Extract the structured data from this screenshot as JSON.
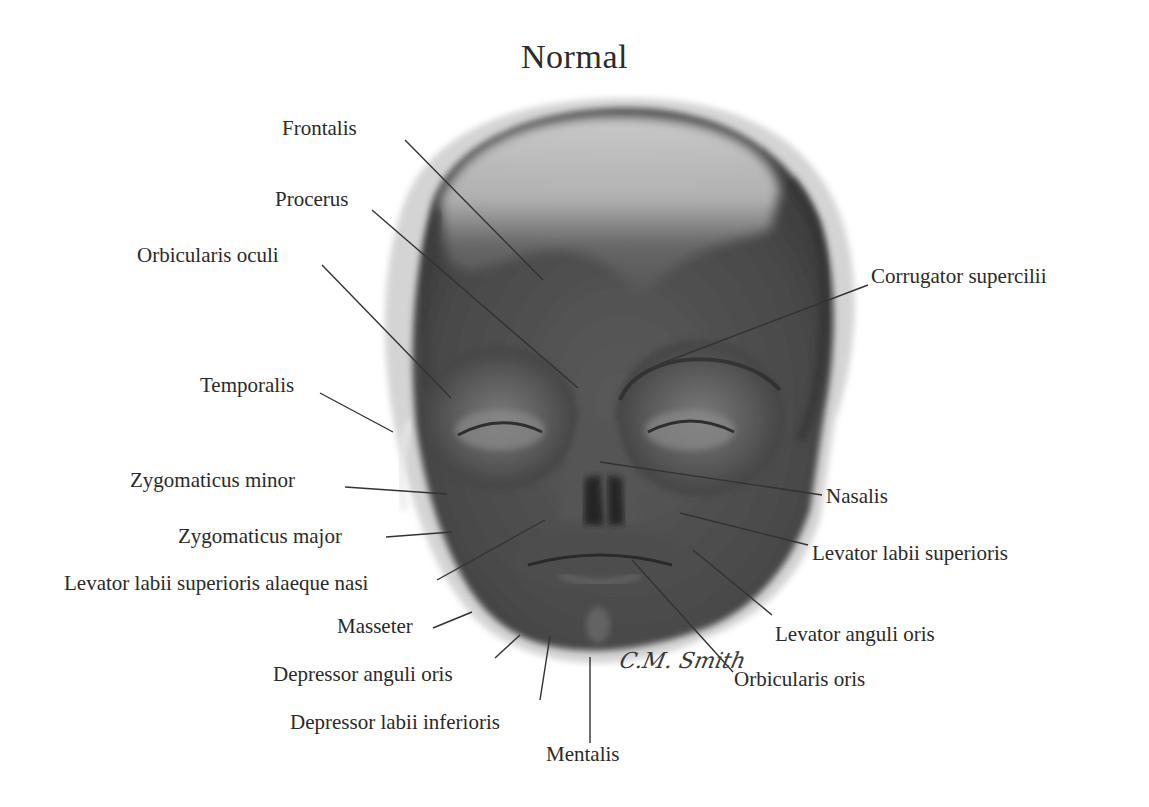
{
  "title": "Normal",
  "signature": "C.M. Smith",
  "illustration": {
    "subject": "infant-face-muscles-anterior-view",
    "palette": {
      "skin_dark": "#4a4a4a",
      "skin_mid": "#6b6b6b",
      "skin_light": "#c8c8c8",
      "highlight": "#e6e6e6",
      "line": "#333333"
    }
  },
  "labels": {
    "left": [
      {
        "id": "frontalis",
        "text": "Frontalis"
      },
      {
        "id": "procerus",
        "text": "Procerus"
      },
      {
        "id": "orbicularis_oculi",
        "text": "Orbicularis oculi"
      },
      {
        "id": "temporalis",
        "text": "Temporalis"
      },
      {
        "id": "zygomaticus_minor",
        "text": "Zygomaticus minor"
      },
      {
        "id": "zygomaticus_major",
        "text": "Zygomaticus major"
      },
      {
        "id": "levator_labii_sup_alaeque_nasi",
        "text": "Levator labii superioris alaeque nasi"
      },
      {
        "id": "masseter",
        "text": "Masseter"
      },
      {
        "id": "depressor_anguli_oris",
        "text": "Depressor anguli oris"
      },
      {
        "id": "depressor_labii_inferioris",
        "text": "Depressor labii inferioris"
      },
      {
        "id": "mentalis",
        "text": "Mentalis"
      }
    ],
    "right": [
      {
        "id": "corrugator_supercilii",
        "text": "Corrugator supercilii"
      },
      {
        "id": "nasalis",
        "text": "Nasalis"
      },
      {
        "id": "levator_labii_superioris",
        "text": "Levator labii superioris"
      },
      {
        "id": "levator_anguli_oris",
        "text": "Levator anguli oris"
      },
      {
        "id": "orbicularis_oris",
        "text": "Orbicularis oris"
      }
    ]
  }
}
